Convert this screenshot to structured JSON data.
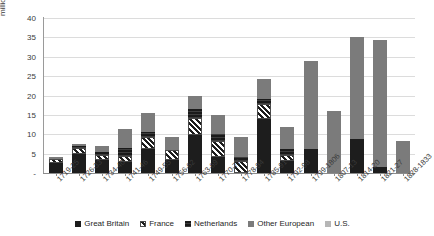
{
  "chart_data": {
    "type": "bar",
    "stacked": true,
    "title": "",
    "xlabel": "",
    "ylabel": "millions of Spanish dollars (pesos)",
    "ylim": [
      0,
      40
    ],
    "ytick_values": [
      "-",
      "5",
      "10",
      "15",
      "20",
      "25",
      "30",
      "35",
      "40"
    ],
    "grid": true,
    "legend_position": "bottom",
    "categories": [
      "1719-25",
      "1726-33",
      "1734-40",
      "1741-46",
      "1749-55",
      "1756-62",
      "1763-69",
      "1770-77",
      "1778-84",
      "1785-91",
      "1792-98",
      "1799-1806",
      "1807-13",
      "1814-20",
      "1821-27",
      "1828-1833"
    ],
    "series": [
      {
        "name": "Great Britain",
        "color": "#1d1d1d",
        "values": [
          2.7,
          4.9,
          3.4,
          2.8,
          6.2,
          3.4,
          9.9,
          4.1,
          0.0,
          13.9,
          3.2,
          6.2,
          0.0,
          8.8,
          1.5,
          0.0
        ]
      },
      {
        "name": "France",
        "color": "#ffffff",
        "values": [
          1.0,
          1.5,
          1.2,
          1.6,
          3.0,
          2.6,
          4.4,
          4.2,
          3.1,
          3.8,
          1.5,
          0.0,
          0.0,
          0.0,
          0.0,
          0.0
        ]
      },
      {
        "name": "Netherlands",
        "color": "#2f2f2f",
        "values": [
          0.0,
          0.5,
          0.8,
          2.0,
          1.4,
          0.0,
          2.1,
          1.8,
          1.0,
          1.3,
          1.5,
          0.0,
          0.0,
          0.0,
          0.0,
          0.0
        ]
      },
      {
        "name": "Other European",
        "color": "#7b7b7b",
        "values": [
          0.5,
          0.6,
          1.6,
          4.9,
          4.8,
          3.2,
          3.6,
          4.9,
          5.2,
          5.2,
          5.8,
          22.8,
          16.1,
          26.2,
          32.7,
          8.3
        ]
      },
      {
        "name": "U.S.",
        "color": "#b6b6b6",
        "values": [
          0.0,
          0.0,
          0.0,
          0.0,
          0.0,
          0.0,
          0.0,
          0.0,
          0.0,
          0.0,
          0.0,
          0.0,
          0.0,
          0.0,
          0.0,
          0.0
        ]
      }
    ],
    "totals": [
      4.2,
      7.5,
      7.0,
      11.3,
      15.4,
      9.2,
      20.0,
      15.0,
      9.3,
      24.2,
      12.0,
      29.0,
      16.1,
      35.0,
      34.2,
      8.3
    ]
  },
  "legend": {
    "items": [
      {
        "label": "Great Britain",
        "key": "gb"
      },
      {
        "label": "France",
        "key": "fr"
      },
      {
        "label": "Netherlands",
        "key": "nl"
      },
      {
        "label": "Other European",
        "key": "oe"
      },
      {
        "label": "U.S.",
        "key": "us"
      }
    ]
  }
}
